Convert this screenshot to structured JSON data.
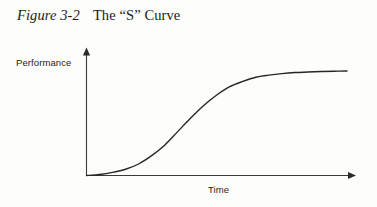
{
  "figure": {
    "number": "Figure 3-2",
    "title": "The “S” Curve",
    "separator": " "
  },
  "chart_data": {
    "type": "line",
    "title": "The “S” Curve",
    "figure_number": "Figure 3-2",
    "xlabel": "Time",
    "ylabel": "Performance",
    "grid": false,
    "legend": false,
    "axis_arrows": {
      "x": "arrow-right",
      "y": "arrow-up"
    },
    "tick_labels": {
      "x": [],
      "y": []
    },
    "xlim": [
      0,
      1
    ],
    "ylim": [
      0,
      1
    ],
    "series": [
      {
        "name": "S Curve",
        "color": "#262626",
        "line_width": 1.4,
        "x": [
          0.0,
          0.05,
          0.1,
          0.15,
          0.2,
          0.25,
          0.3,
          0.35,
          0.4,
          0.45,
          0.5,
          0.55,
          0.6,
          0.65,
          0.7,
          0.75,
          0.8,
          0.85,
          0.9,
          0.95,
          1.0
        ],
        "y": [
          0.0,
          0.01,
          0.03,
          0.06,
          0.11,
          0.19,
          0.29,
          0.42,
          0.55,
          0.67,
          0.77,
          0.85,
          0.9,
          0.94,
          0.96,
          0.975,
          0.985,
          0.99,
          0.995,
          0.998,
          1.0
        ],
        "inflection_point": {
          "x": 0.4,
          "y": 0.55
        },
        "plateau_value": 1.0
      }
    ]
  },
  "labels": {
    "y_axis": "Performance",
    "x_axis": "Time"
  },
  "colors": {
    "background": "#fdfdfc",
    "ink": "#1b1b1b",
    "curve": "#262626",
    "axis": "#3a3a3a"
  }
}
